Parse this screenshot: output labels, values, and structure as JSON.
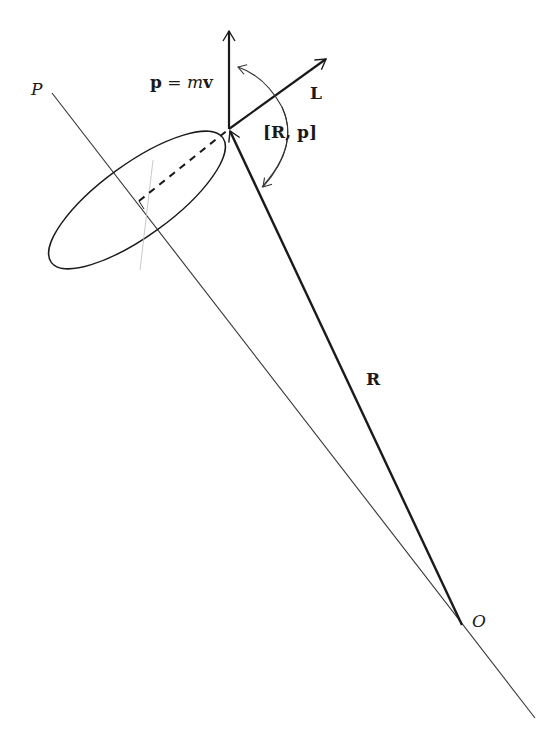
{
  "diagram": {
    "labels": {
      "p_eq_lhs": "p",
      "p_eq_mid": " = ",
      "p_eq_m": "m",
      "p_eq_v": "v",
      "L": "L",
      "commutator": "[R, p]",
      "R": "R",
      "P": "P",
      "O": "O"
    },
    "colors": {
      "ink": "#1a1a1a",
      "thin_line": "#333333",
      "background": "#ffffff"
    }
  }
}
